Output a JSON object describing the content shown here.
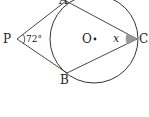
{
  "diagram": {
    "type": "geometry",
    "points": {
      "P": {
        "label": "P",
        "x": 17,
        "y": 39
      },
      "A": {
        "label": "A",
        "x": 66,
        "y": 1
      },
      "B": {
        "label": "B",
        "x": 67,
        "y": 73
      },
      "C": {
        "label": "C",
        "x": 137,
        "y": 39
      },
      "O": {
        "label": "O",
        "x": 94,
        "y": 39
      }
    },
    "circle": {
      "cx": 94,
      "cy": 39,
      "r": 44
    },
    "angles": {
      "P": {
        "label": "72°",
        "value": 72
      },
      "C": {
        "label": "x",
        "shaded_color": "#999999"
      }
    },
    "stroke_color": "#333333"
  }
}
